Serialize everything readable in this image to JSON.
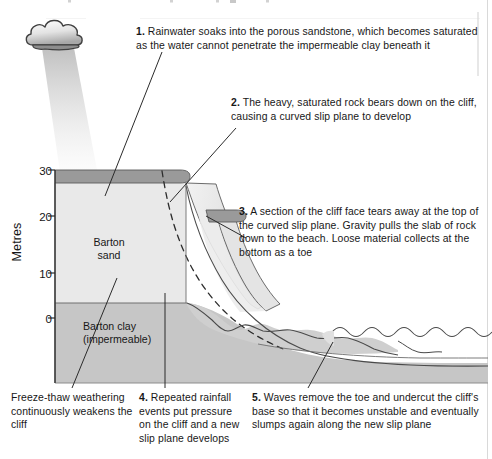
{
  "figure": {
    "type": "cross-section-diagram",
    "cut_off_header": "",
    "axis": {
      "title": "Metres",
      "ticks": [
        "30",
        "20",
        "10",
        "0"
      ],
      "tick_values": [
        30,
        20,
        10,
        0
      ],
      "range_min": -12,
      "range_max": 32
    },
    "strata": [
      {
        "id": "sand",
        "label_line1": "Barton",
        "label_line2": "sand",
        "color": "#e9e9e9",
        "top_metres": 28,
        "bottom_metres": 5
      },
      {
        "id": "clay",
        "label_line1": "Barton clay",
        "label_line2": "(impermeable)",
        "color": "#c6c6c6",
        "top_metres": 5,
        "bottom_metres": -12
      },
      {
        "id": "topsoil",
        "label": "",
        "color": "#9a9a9a",
        "top_metres": 30,
        "bottom_metres": 28
      }
    ],
    "features": {
      "cloud": "rain-cloud",
      "rain_shaft": "rainfall",
      "slip_plane": "curved dashed slip plane",
      "slumped_block": "rotated slab of cliff",
      "toe": "loose material collecting at the bottom as a toe",
      "sea": "waves",
      "beach": "beach surface"
    }
  },
  "notes": {
    "n1": {
      "number": "1.",
      "text": " Rainwater soaks into the porous sandstone, which becomes saturated as the water cannot penetrate the impermeable clay beneath it"
    },
    "n2": {
      "number": "2.",
      "text": " The heavy, saturated rock bears down on the cliff, causing a curved slip plane to develop"
    },
    "n3": {
      "number": "3.",
      "text": " A section of the cliff face tears away at the top of the curved slip plane. Gravity pulls the slab of rock down to the beach. Loose material collects at the bottom as a toe"
    },
    "n4": {
      "number": "4.",
      "text": " Repeated rainfall events put pressure on the cliff and a new slip plane develops"
    },
    "n5": {
      "number": "5.",
      "text": " Waves remove the toe and undercut the cliff's base so that it becomes unstable and eventually slumps again along the new slip plane"
    },
    "freeze_thaw": {
      "number": "",
      "text": "Freeze-thaw weathering continuously weakens the cliff"
    }
  },
  "labels": {
    "sand_l1": "Barton",
    "sand_l2": "sand",
    "clay_l1": "Barton clay",
    "clay_l2": "(impermeable)",
    "axis_title": "Metres",
    "tick_30": "30",
    "tick_20": "20",
    "tick_10": "10",
    "tick_0": "0"
  },
  "colors": {
    "sand": "#e9e9e9",
    "clay": "#c6c6c6",
    "topsoil": "#9a9a9a",
    "outline": "#4a4a4a",
    "text": "#171717",
    "page_bg": "#ffffff",
    "cloud": "#d8d8d8",
    "rain": "#e4e4e4"
  }
}
